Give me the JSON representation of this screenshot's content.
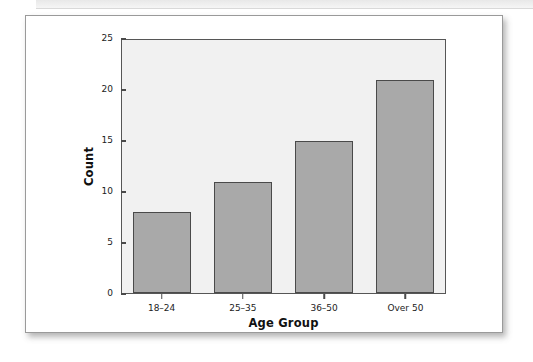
{
  "page": {
    "background_color": "#ffffff",
    "scan_band_color": "#ececec"
  },
  "figure": {
    "card_background": "#ffffff",
    "card_border_color": "#9a9a9a"
  },
  "chart_data": {
    "type": "bar",
    "title": "",
    "subtitle": "",
    "categories": [
      "18–24",
      "25–35",
      "36–50",
      "Over 50"
    ],
    "values": [
      8,
      11,
      15,
      21
    ],
    "series": [
      {
        "name": "Count",
        "values": [
          8,
          11,
          15,
          21
        ]
      }
    ],
    "xlabel": "Age Group",
    "ylabel": "Count",
    "ylim": [
      0,
      25
    ],
    "yticks": [
      0,
      5,
      10,
      15,
      20,
      25
    ],
    "ytick_labels": [
      "0",
      "5",
      "10",
      "15",
      "20",
      "25"
    ],
    "grid": false,
    "legend": null,
    "legend_position": "none",
    "bar_fill_color": "#a9a9a9",
    "bar_edge_color": "#4a4a4a",
    "plot_background_color": "#f1f1f1",
    "axis_color": "#565656",
    "annotations": []
  }
}
